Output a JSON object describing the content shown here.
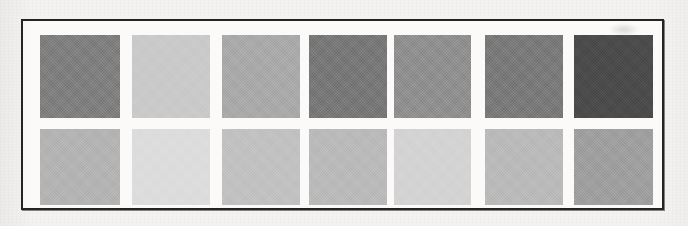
{
  "figure": {
    "kind": "grayscale-swatch-panel",
    "frame_color": "#242424",
    "panel_background": "#fbfaf8",
    "page_background": "#f4f3f1"
  },
  "chart_data": {
    "type": "heatmap",
    "title": "",
    "subtitle": "",
    "xlabel": "",
    "ylabel": "",
    "grid": false,
    "legend_position": "none",
    "columns": 7,
    "rows": 2,
    "categories": [
      "1",
      "2",
      "3",
      "4",
      "5",
      "6",
      "7"
    ],
    "row_labels": [
      "Top row",
      "Bottom row"
    ],
    "series": [
      {
        "name": "Top row",
        "colors": [
          "#7e7e7e",
          "#c9c9c9",
          "#a9a9a9",
          "#777777",
          "#8f8f8f",
          "#797979",
          "#4b4b4b"
        ],
        "values": [
          126,
          201,
          169,
          119,
          143,
          121,
          75
        ]
      },
      {
        "name": "Bottom row",
        "colors": [
          "#b3b3b3",
          "#dcdcdc",
          "#c1c1c1",
          "#b9b9b9",
          "#d3d3d3",
          "#b9b9b9",
          "#9e9e9e"
        ],
        "values": [
          179,
          220,
          193,
          185,
          211,
          185,
          158
        ]
      }
    ]
  },
  "swatch_geometry": {
    "top_row": [
      {
        "left": 17,
        "width": 80
      },
      {
        "left": 109,
        "width": 78
      },
      {
        "left": 199,
        "width": 78
      },
      {
        "left": 286,
        "width": 78
      },
      {
        "left": 371,
        "width": 77
      },
      {
        "left": 462,
        "width": 78
      },
      {
        "left": 551,
        "width": 79
      }
    ],
    "bottom_row": [
      {
        "left": 17,
        "width": 80
      },
      {
        "left": 109,
        "width": 78
      },
      {
        "left": 199,
        "width": 78
      },
      {
        "left": 286,
        "width": 78
      },
      {
        "left": 371,
        "width": 77
      },
      {
        "left": 462,
        "width": 78
      },
      {
        "left": 551,
        "width": 79
      }
    ]
  }
}
